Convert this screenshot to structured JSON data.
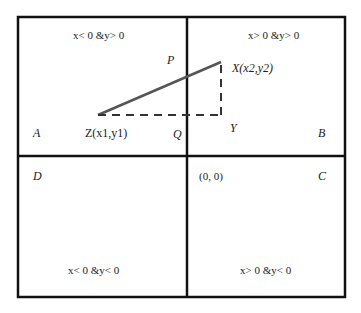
{
  "diagram": {
    "colors": {
      "border": "#111111",
      "segment": "#555555",
      "text": "#222222",
      "background": "#ffffff"
    },
    "quadrants": [
      {
        "id": "A",
        "label": "A",
        "condition": "x< 0 &y> 0"
      },
      {
        "id": "B",
        "label": "B",
        "condition": "x> 0 &y> 0"
      },
      {
        "id": "C",
        "label": "C",
        "condition": "x> 0 &y< 0"
      },
      {
        "id": "D",
        "label": "D",
        "condition": "x< 0 &y< 0"
      }
    ],
    "origin_label": "(0, 0)",
    "points": {
      "Z": "Z(x1,y1)",
      "X": "X(x2,y2)",
      "P": "P",
      "Q": "Q",
      "Y": "Y"
    }
  }
}
